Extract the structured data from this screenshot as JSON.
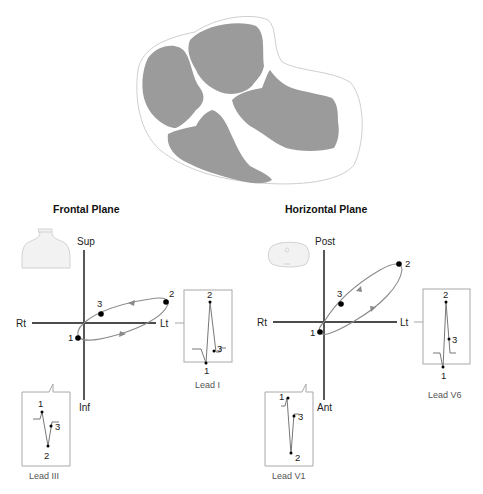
{
  "figure": {
    "heart": {
      "label": "heart-cross-section",
      "fill_color": "#9b9b9b",
      "outline_color": "#cfcfcf"
    },
    "panels": [
      {
        "title": "Frontal Plane",
        "axes": {
          "top": "Sup",
          "bottom": "Inf",
          "left": "Rt",
          "right": "Lt"
        },
        "loop_points": [
          "1",
          "2",
          "3"
        ],
        "icon": "torso-icon",
        "leads": [
          {
            "name": "Lead I",
            "points": [
              "1",
              "2",
              "3"
            ]
          },
          {
            "name": "Lead III",
            "points": [
              "1",
              "2",
              "3"
            ]
          }
        ]
      },
      {
        "title": "Horizontal Plane",
        "axes": {
          "top": "Post",
          "bottom": "Ant",
          "left": "Rt",
          "right": "Lt"
        },
        "loop_points": [
          "1",
          "2",
          "3"
        ],
        "icon": "thorax-cross-section-icon",
        "leads": [
          {
            "name": "Lead V6",
            "points": [
              "1",
              "2",
              "3"
            ]
          },
          {
            "name": "Lead V1",
            "points": [
              "1",
              "2",
              "3"
            ]
          }
        ]
      }
    ],
    "colors": {
      "axis": "#111111",
      "loop": "#8a8a8a",
      "box": "#a8a8a8",
      "trace": "#777777",
      "dot": "#000000"
    }
  }
}
